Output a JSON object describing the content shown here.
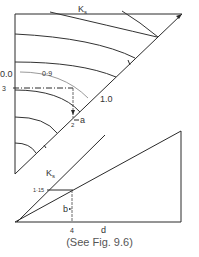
{
  "figure": {
    "upper": {
      "label_ks": "K",
      "label_ks_sub": "s",
      "label_00": "0.0",
      "label_09": "0·9",
      "label_10": "1.0",
      "label_3": "3",
      "label_2": "2",
      "label_a": "a"
    },
    "lower": {
      "label_ks": "K",
      "label_ks_sub": "s",
      "label_115": "1·15",
      "label_b": "b",
      "label_4": "4",
      "label_d": "d"
    },
    "caption": "(See Fig. 9.6)"
  }
}
